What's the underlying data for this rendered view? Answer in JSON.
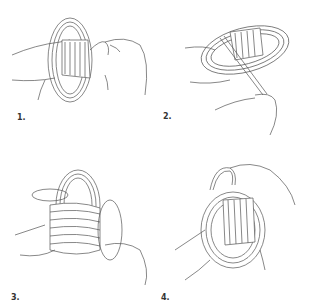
{
  "steps": [
    {
      "label": "1.",
      "description": "Hand holding coiled rope with wrap around middle, other hand pulling loose end"
    },
    {
      "label": "2.",
      "description": "Rope end wrapped diagonally across coil, pulled downward by hand"
    },
    {
      "label": "3.",
      "description": "Coil wrapped tightly, loop of rope end passing through top"
    },
    {
      "label": "4.",
      "description": "Finished wrapped coil with loop pulled through, held in hand"
    }
  ]
}
